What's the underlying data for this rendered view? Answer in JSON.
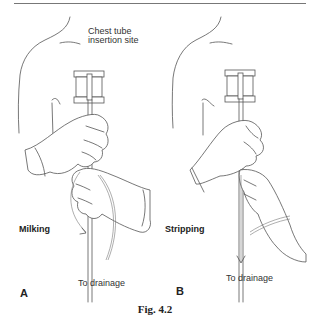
{
  "figure": {
    "caption": "Fig. 4.2",
    "panels": [
      {
        "letter": "A",
        "technique": "Milking",
        "annotation": "Chest tube insertion site",
        "annotation_line1": "Chest tube",
        "annotation_line2": "insertion site",
        "drainage_label": "To drainage"
      },
      {
        "letter": "B",
        "technique": "Stripping",
        "drainage_label": "To drainage"
      }
    ]
  }
}
